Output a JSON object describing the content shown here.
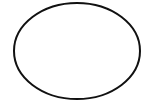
{
  "canvas": {
    "width": 153,
    "height": 107,
    "background": "#ffffff"
  },
  "shapes": [
    {
      "type": "ellipse",
      "cx": 77,
      "cy": 51,
      "rx": 63,
      "ry": 48,
      "stroke": "#111111",
      "stroke_width": 2,
      "fill": "#ffffff"
    }
  ]
}
